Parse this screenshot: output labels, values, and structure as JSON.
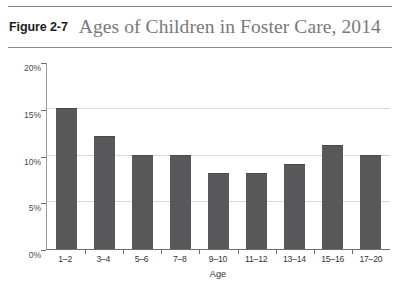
{
  "figure": {
    "number": "Figure 2-7",
    "title": "Ages of Children in Foster Care, 2014"
  },
  "chart_data": {
    "type": "bar",
    "title": "Ages of Children in Foster Care, 2014",
    "xlabel": "Age",
    "ylabel": "",
    "categories": [
      "1–2",
      "3–4",
      "5–6",
      "7–8",
      "9–10",
      "11–12",
      "13–14",
      "15–16",
      "17–20"
    ],
    "values": [
      15,
      12,
      10,
      10,
      8,
      8,
      9,
      11,
      10
    ],
    "value_unit": "%",
    "ylim": [
      0,
      20
    ],
    "ytick_labels": [
      "0%",
      "5%",
      "10%",
      "15%",
      "20%"
    ],
    "ytick_values": [
      0,
      5,
      10,
      15,
      20
    ],
    "grid": true,
    "gridlines_at": [
      5,
      10,
      15
    ],
    "legend": null,
    "bar_color": "#58585a",
    "gridline_color": "#d8d8da",
    "axis_color": "#6e6e71",
    "background": "#ffffff"
  }
}
